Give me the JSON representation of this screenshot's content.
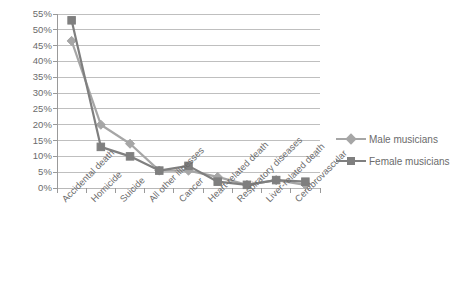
{
  "chart_data": {
    "type": "line",
    "title": "",
    "subtitle": "",
    "xlabel": "",
    "ylabel": "",
    "ylim": [
      0,
      55
    ],
    "ytick_step": 5,
    "grid": true,
    "legend_position": "right",
    "categories": [
      "Accidental death",
      "Homicide",
      "Suicide",
      "All other illnesses",
      "Cancer",
      "Heart-related death",
      "Respiratory diseases",
      "Liver-related death",
      "Cerebrovascular"
    ],
    "ytick_labels": [
      "0%",
      "5%",
      "10%",
      "15%",
      "20%",
      "25%",
      "30%",
      "35%",
      "40%",
      "45%",
      "50%",
      "55%"
    ],
    "series": [
      {
        "name": "Male musicians",
        "color": "#a6a6a6",
        "marker": "diamond",
        "values": [
          46.5,
          20.0,
          14.0,
          5.5,
          5.5,
          3.5,
          1.0,
          2.5,
          1.0
        ]
      },
      {
        "name": "Female musicians",
        "color": "#7f7f7f",
        "marker": "square",
        "values": [
          53.0,
          13.0,
          10.0,
          5.5,
          7.0,
          2.0,
          1.0,
          2.5,
          2.0
        ]
      }
    ]
  },
  "legend": {
    "items": [
      {
        "label": "Male musicians"
      },
      {
        "label": "Female musicians"
      }
    ]
  },
  "colors": {
    "male": "#a6a6a6",
    "female": "#7f7f7f",
    "grid": "#b8b8b8",
    "axis": "#9a9a9a",
    "text": "#6b6b6b",
    "background": "#ffffff"
  }
}
